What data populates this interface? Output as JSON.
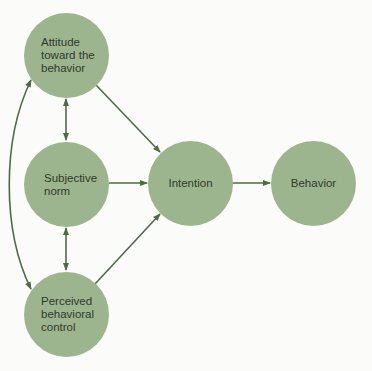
{
  "diagram": {
    "colors": {
      "node_fill": "#9db58f",
      "arrow": "#4f6b45",
      "text": "#2f3a2b",
      "background": "#fbfbf9"
    },
    "nodes": {
      "attitude": {
        "label": "Attitude\ntoward the\nbehavior"
      },
      "subjective_norm": {
        "label": "Subjective\nnorm"
      },
      "perceived_control": {
        "label": "Perceived\nbehavioral\ncontrol"
      },
      "intention": {
        "label": "Intention"
      },
      "behavior": {
        "label": "Behavior"
      }
    },
    "edges": [
      {
        "from": "attitude",
        "to": "intention",
        "type": "directed"
      },
      {
        "from": "subjective_norm",
        "to": "intention",
        "type": "directed"
      },
      {
        "from": "perceived_control",
        "to": "intention",
        "type": "directed"
      },
      {
        "from": "intention",
        "to": "behavior",
        "type": "directed"
      },
      {
        "from": "attitude",
        "to": "subjective_norm",
        "type": "bidirectional"
      },
      {
        "from": "subjective_norm",
        "to": "perceived_control",
        "type": "bidirectional"
      },
      {
        "from": "attitude",
        "to": "perceived_control",
        "type": "bidirectional-curved"
      }
    ]
  }
}
